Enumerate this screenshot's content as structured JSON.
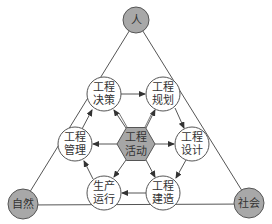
{
  "diagram": {
    "type": "concept-diagram",
    "colors": {
      "line": "#555555",
      "corner_fill": "#a8a8a8",
      "center_fill": "#a6a6a6",
      "node_fill": "#ffffff",
      "text": "#333333"
    },
    "corners": {
      "top": {
        "label": "人"
      },
      "bottom_left": {
        "label": "自然"
      },
      "bottom_right": {
        "label": "社会"
      }
    },
    "center": {
      "line1": "工程",
      "line2": "活动"
    },
    "nodes": [
      {
        "id": "decision",
        "line1": "工程",
        "line2": "决策"
      },
      {
        "id": "planning",
        "line1": "工程",
        "line2": "规划"
      },
      {
        "id": "design",
        "line1": "工程",
        "line2": "设计"
      },
      {
        "id": "construction",
        "line1": "工程",
        "line2": "建造"
      },
      {
        "id": "operation",
        "line1": "生产",
        "line2": "运行"
      },
      {
        "id": "management",
        "line1": "工程",
        "line2": "管理"
      }
    ],
    "cycle_arrows": [
      "工程决策 → 工程规划",
      "工程规划 → 工程设计",
      "工程设计 → 工程建造",
      "工程建造 → 生产运行",
      "生产运行 → 工程管理",
      "工程管理 → 工程决策"
    ],
    "center_arrows": "工程活动 → all six surrounding nodes"
  }
}
